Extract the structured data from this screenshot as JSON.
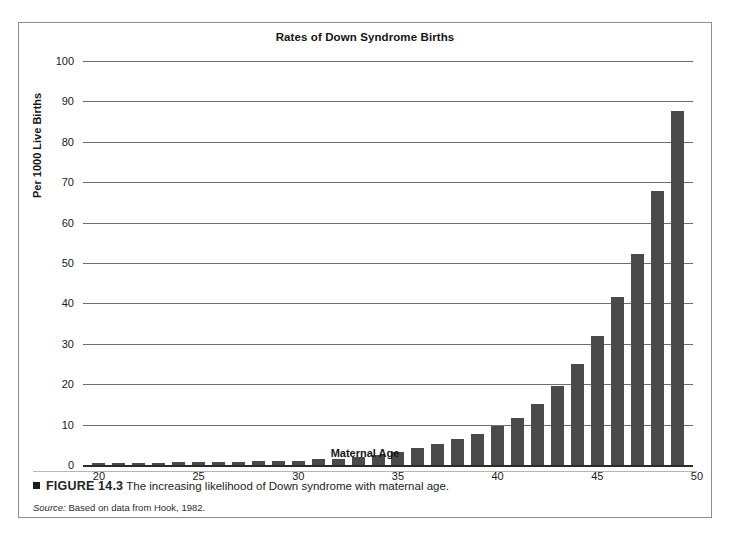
{
  "figure": {
    "marker_icon": "square-bullet-icon",
    "number_label": "FIGURE 14.3",
    "caption_text": "The increasing likelihood of Down syndrome with maternal age.",
    "source_label": "Source:",
    "source_text": " Based on data from Hook, 1982."
  },
  "colors": {
    "bar": "#4a4a4a",
    "gridline": "#6e6e6e",
    "axis": "#2b2b2b",
    "frame": "#8d8d8d",
    "background": "#ffffff"
  },
  "chart_data": {
    "type": "bar",
    "title": "Rates of Down Syndrome Births",
    "xlabel": "Maternal Age",
    "ylabel": "Per 1000 Live Births",
    "xlim": [
      19.2,
      49.8
    ],
    "ylim": [
      0,
      100
    ],
    "ytick_values": [
      0,
      10,
      20,
      30,
      40,
      50,
      60,
      70,
      80,
      90,
      100
    ],
    "ytick_labels": [
      "0",
      "10",
      "20",
      "30",
      "40",
      "50",
      "60",
      "70",
      "80",
      "90",
      "100"
    ],
    "xtick_values": [
      20,
      25,
      30,
      35,
      40,
      45,
      50
    ],
    "xtick_labels": [
      "20",
      "25",
      "30",
      "35",
      "40",
      "45",
      "50"
    ],
    "grid": true,
    "legend": false,
    "categories": [
      20,
      21,
      22,
      23,
      24,
      25,
      26,
      27,
      28,
      29,
      30,
      31,
      32,
      33,
      34,
      35,
      36,
      37,
      38,
      39,
      40,
      41,
      42,
      43,
      44,
      45,
      46,
      47,
      48,
      49
    ],
    "values": [
      0.6,
      0.6,
      0.6,
      0.6,
      0.7,
      0.7,
      0.8,
      0.8,
      0.9,
      1.0,
      1.1,
      1.4,
      1.6,
      2.1,
      2.6,
      3.2,
      4.1,
      5.1,
      6.5,
      7.6,
      9.6,
      11.7,
      15.1,
      19.6,
      24.9,
      31.9,
      41.6,
      52.2,
      67.8,
      87.6
    ],
    "value_unit": "per 1000 live births",
    "series": [
      {
        "name": "Rate of Down syndrome births per 1000 live births",
        "values": [
          0.6,
          0.6,
          0.6,
          0.6,
          0.7,
          0.7,
          0.8,
          0.8,
          0.9,
          1.0,
          1.1,
          1.4,
          1.6,
          2.1,
          2.6,
          3.2,
          4.1,
          5.1,
          6.5,
          7.6,
          9.6,
          11.7,
          15.1,
          19.6,
          24.9,
          31.9,
          41.6,
          52.2,
          67.8,
          87.6
        ]
      }
    ]
  }
}
